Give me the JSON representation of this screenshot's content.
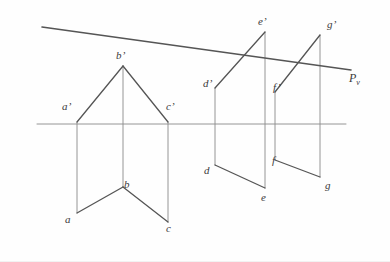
{
  "figure": {
    "background_color": "#fefefe",
    "stroke_color": "#555555",
    "thin_stroke_color": "#8a8a8a",
    "label_color": "#3a3a3a"
  },
  "ground_line": {
    "name": "xy-ground-line",
    "x1": 37,
    "y1": 124,
    "x2": 346,
    "y2": 124,
    "stroke_width": 0.9
  },
  "plane_trace": {
    "name": "Pv",
    "label": "P",
    "subscript": "v",
    "x1": 42,
    "y1": 27,
    "x2": 351,
    "y2": 70,
    "stroke_width": 1.6,
    "label_x": 349,
    "label_y": 72
  },
  "labels": [
    {
      "id": "a-prime",
      "text": "a’",
      "x": 62,
      "y": 101
    },
    {
      "id": "b-prime",
      "text": "b’",
      "x": 116,
      "y": 50
    },
    {
      "id": "c-prime",
      "text": "c’",
      "x": 166,
      "y": 101
    },
    {
      "id": "a",
      "text": "a",
      "x": 65,
      "y": 214
    },
    {
      "id": "b",
      "text": "b",
      "x": 124,
      "y": 179
    },
    {
      "id": "c",
      "text": "c",
      "x": 166,
      "y": 223
    },
    {
      "id": "d-prime",
      "text": "d’",
      "x": 203,
      "y": 78
    },
    {
      "id": "e-prime",
      "text": "e’",
      "x": 258,
      "y": 16
    },
    {
      "id": "f-prime",
      "text": "f’",
      "x": 273,
      "y": 82
    },
    {
      "id": "g-prime",
      "text": "g’",
      "x": 327,
      "y": 19
    },
    {
      "id": "d",
      "text": "d",
      "x": 204,
      "y": 165
    },
    {
      "id": "e",
      "text": "e",
      "x": 261,
      "y": 192
    },
    {
      "id": "f",
      "text": "f",
      "x": 272,
      "y": 155
    },
    {
      "id": "g",
      "text": "g",
      "x": 325,
      "y": 180
    }
  ],
  "geometry": {
    "front_view_left": {
      "name": "triangle-a-b-c-prime",
      "points": [
        {
          "id": "a-prime",
          "x": 77,
          "y": 122
        },
        {
          "id": "b-prime",
          "x": 123,
          "y": 66
        },
        {
          "id": "c-prime",
          "x": 168,
          "y": 122
        }
      ],
      "edges": [
        {
          "from": "a-prime",
          "to": "b-prime"
        },
        {
          "from": "b-prime",
          "to": "c-prime"
        }
      ]
    },
    "top_view_left": {
      "name": "polyline-a-b-c",
      "points": [
        {
          "id": "a",
          "x": 77,
          "y": 213
        },
        {
          "id": "b",
          "x": 123,
          "y": 187
        },
        {
          "id": "c",
          "x": 168,
          "y": 222
        }
      ],
      "edges": [
        {
          "from": "a",
          "to": "b"
        },
        {
          "from": "b",
          "to": "c"
        }
      ]
    },
    "front_view_right_de": {
      "name": "shape-d-e-prime",
      "points": [
        {
          "id": "d-prime",
          "x": 215,
          "y": 88
        },
        {
          "id": "e-prime",
          "x": 265,
          "y": 32
        }
      ],
      "edges": [
        {
          "from": "d-prime",
          "to": "e-prime"
        }
      ]
    },
    "front_view_right_fg": {
      "name": "shape-f-g-prime",
      "points": [
        {
          "id": "f-prime",
          "x": 275,
          "y": 92
        },
        {
          "id": "g-prime",
          "x": 320,
          "y": 35
        }
      ],
      "edges": [
        {
          "from": "f-prime",
          "to": "g-prime"
        }
      ]
    },
    "top_view_right_de": {
      "name": "polyline-d-e",
      "points": [
        {
          "id": "d",
          "x": 215,
          "y": 165
        },
        {
          "id": "e",
          "x": 265,
          "y": 188
        }
      ],
      "edges": [
        {
          "from": "d",
          "to": "e"
        }
      ]
    },
    "top_view_right_fg": {
      "name": "polyline-f-g",
      "points": [
        {
          "id": "f",
          "x": 275,
          "y": 160
        },
        {
          "id": "g",
          "x": 320,
          "y": 177
        }
      ],
      "edges": [
        {
          "from": "f",
          "to": "g"
        }
      ]
    },
    "projectors": [
      {
        "id": "proj-a",
        "x": 77,
        "y1": 122,
        "y2": 213
      },
      {
        "id": "proj-b",
        "x": 123,
        "y1": 66,
        "y2": 187
      },
      {
        "id": "proj-c",
        "x": 168,
        "y1": 122,
        "y2": 222
      },
      {
        "id": "proj-d",
        "x": 215,
        "y1": 88,
        "y2": 165
      },
      {
        "id": "proj-e",
        "x": 265,
        "y1": 32,
        "y2": 188
      },
      {
        "id": "proj-f",
        "x": 275,
        "y1": 92,
        "y2": 160
      },
      {
        "id": "proj-g",
        "x": 320,
        "y1": 35,
        "y2": 177
      }
    ]
  }
}
